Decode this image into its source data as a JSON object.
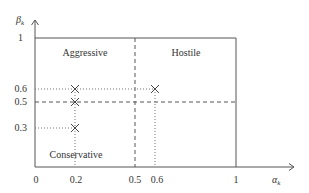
{
  "diagram": {
    "axes": {
      "x_label": "α",
      "x_label_sub": "k",
      "y_label": "β",
      "y_label_sub": "k",
      "x_ticks": [
        "0",
        "0.2",
        "0.5",
        "0.6",
        "1"
      ],
      "y_ticks": [
        "1",
        "0.6",
        "0.5",
        "0.3"
      ]
    },
    "regions": {
      "top_left": "Aggressive",
      "top_right": "Hostile",
      "bottom_left": "Conservative"
    },
    "points": [
      {
        "alpha": 0.2,
        "beta": 0.6
      },
      {
        "alpha": 0.2,
        "beta": 0.5
      },
      {
        "alpha": 0.2,
        "beta": 0.3
      },
      {
        "alpha": 0.6,
        "beta": 0.6
      }
    ],
    "thresholds": {
      "alpha": 0.5,
      "beta": 0.5
    },
    "colors": {
      "line": "#555555",
      "text": "#333333"
    }
  }
}
